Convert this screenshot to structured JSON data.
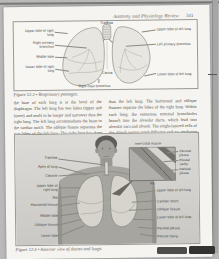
{
  "header": {
    "title": "Anatomy and Physiology Review",
    "page_number": "341"
  },
  "figure_respiratory": {
    "caption": "Figure 12.2 • Respiratory passages.",
    "labels": {
      "trachea": "Trachea",
      "upper_lobe_right": "Upper lobe of right lung",
      "right_primary_bronchus": "Right primary bronchus",
      "middle_lobe": "Middle lobe",
      "lower_lobe_right": "Lower lobe of right lung",
      "upper_lobe_left": "Upper lobe of left lung",
      "left_primary_bronchus": "Left primary bronchus",
      "lower_lobe_left": "Lower lobe of left lung",
      "carina": "Carina",
      "right_main_bronchus": "Right main bronchus"
    }
  },
  "body_text": {
    "column1": "the base of each lung is at the level of the diaphragm. The left lung has two lobes (upper and lower) and tends to be longer and narrower than the right lung. The left lung accommodates the heart in the cardiac notch. The oblique fissure separates the two lobes of the left lung. The right lung has three lobes (upper, middle, and lower) and is slightly larger, wider and shorter",
    "column2": "than the left lung. The horizontal and oblique fissures separate the lobes of the right lung. Within each lung, the numerous terminal bronchioles branch into the alveolar ducts, which lead into alveolar sacs and alveoli. The single-layered cells of the alveoli permit rapid diffusion and gas exchange to occur (see Figure 12.3 ●)."
  },
  "figure_thorax": {
    "caption": "Figure 12.3 • Anterior view of thorax and lungs.",
    "inset": {
      "title": "Intercostal muscle",
      "labels": [
        "Visceral pleura",
        "Pleural cavity",
        "Parietal pleura"
      ],
      "bottom_label": "Rib"
    },
    "left_labels": [
      "Trachea",
      "Apex of lung",
      "Clavicle",
      "Upper lobe of right lung",
      "Rib",
      "Horizontal fissure",
      "Middle lobe",
      "Oblique fissure",
      "Lower lobe"
    ],
    "right_labels": [
      "Upper lobe of left lung",
      "Cardiac notch",
      "Oblique fissure",
      "Lower lobe of left lung",
      "Parietal pleura",
      "Pleural cavity"
    ]
  }
}
